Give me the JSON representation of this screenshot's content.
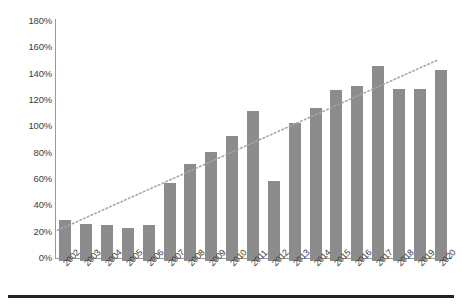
{
  "chart_data": {
    "type": "bar",
    "title": "",
    "xlabel": "",
    "ylabel": "",
    "grid": false,
    "legend": "none",
    "ylim": [
      0,
      180
    ],
    "ytick_labels": [
      "180%",
      "160%",
      "140%",
      "120%",
      "100%",
      "80%",
      "60%",
      "40%",
      "20%",
      "0%"
    ],
    "ytick_values": [
      180,
      160,
      140,
      120,
      100,
      80,
      60,
      40,
      20,
      0
    ],
    "categories": [
      "2002",
      "2003",
      "2004",
      "2005",
      "2006",
      "2007",
      "2008",
      "2009",
      "2010",
      "2011",
      "2012",
      "2013",
      "2014",
      "2015",
      "2016",
      "2017",
      "2018",
      "2019",
      "2020"
    ],
    "values": [
      31,
      28,
      27,
      25,
      27,
      59,
      74,
      83,
      95,
      114,
      61,
      105,
      116,
      130,
      133,
      148,
      131,
      131,
      145
    ],
    "value_unit": "%",
    "series": [
      {
        "name": "Series 1",
        "type": "bar",
        "color": "#8c8c8c",
        "values": [
          31,
          28,
          27,
          25,
          27,
          59,
          74,
          83,
          95,
          114,
          61,
          105,
          116,
          130,
          133,
          148,
          131,
          131,
          145
        ]
      },
      {
        "name": "Linear trendline",
        "type": "line",
        "style": "dotted",
        "color": "#a6a6a6",
        "start_value": 21,
        "end_value": 150,
        "start_category": "2002",
        "end_category": "2020"
      }
    ],
    "annotations": []
  },
  "colors": {
    "bar": "#8c8c8c",
    "trendline": "#a6a6a6",
    "axis": "#9a9a9a",
    "text": "#3d3d3d",
    "background": "#ffffff",
    "bottom_rule": "#222222"
  }
}
